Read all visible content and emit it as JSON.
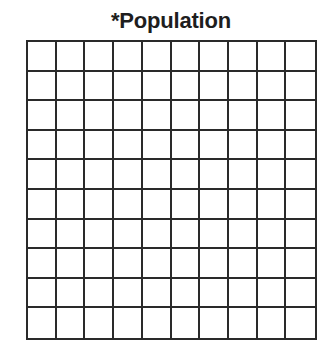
{
  "title": "*Population",
  "grid": {
    "rows": 10,
    "columns": 10,
    "line_color": "#2a2a2a"
  }
}
